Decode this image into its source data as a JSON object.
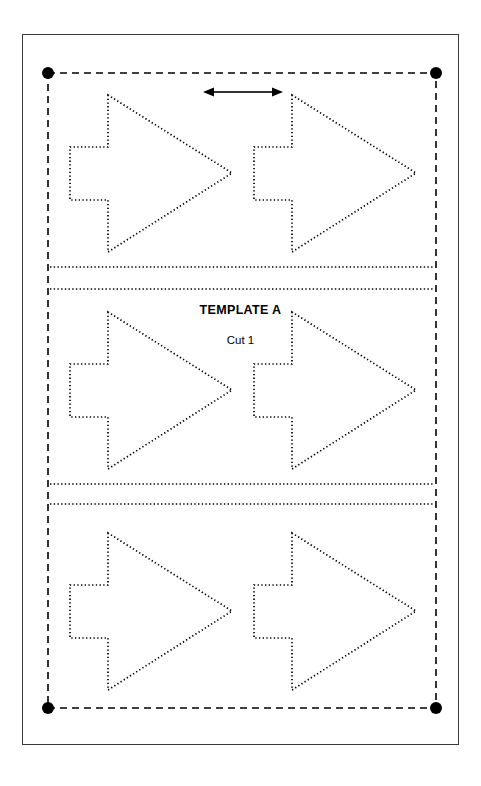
{
  "page": {
    "background_color": "#ffffff",
    "frame": {
      "color": "#3a3a3a",
      "x": 22,
      "y": 34,
      "width": 437,
      "height": 711
    }
  },
  "labels": {
    "template_name": "TEMPLATE A",
    "cut_label": "Cut 1"
  },
  "colors": {
    "ink": "#000000",
    "frame": "#3a3a3a",
    "paper": "#ffffff"
  },
  "fabric_boundary": {
    "style": "dashed",
    "stroke": "#000000",
    "x": 48,
    "y": 73,
    "width": 388,
    "height": 635,
    "corner_markers": [
      {
        "name": "top-left",
        "x": 48,
        "y": 73
      },
      {
        "name": "top-right",
        "x": 436,
        "y": 73
      },
      {
        "name": "bottom-left",
        "x": 48,
        "y": 708
      },
      {
        "name": "bottom-right",
        "x": 436,
        "y": 708
      }
    ],
    "corner_marker_radius": 6
  },
  "dimension_arrow": {
    "name": "width-dimension",
    "orientation": "horizontal",
    "double_headed": true,
    "x1": 203,
    "x2": 283,
    "y": 92,
    "stroke": "#333333"
  },
  "cut_lines": [
    {
      "name": "cut-line-1",
      "y": 267,
      "x1": 50,
      "x2": 434
    },
    {
      "name": "cut-line-2",
      "y": 289,
      "x1": 50,
      "x2": 434
    },
    {
      "name": "cut-line-3",
      "y": 484,
      "x1": 50,
      "x2": 434
    },
    {
      "name": "cut-line-4",
      "y": 504,
      "x1": 50,
      "x2": 434
    }
  ],
  "arrow_shape": {
    "description": "right-pointing arrow with rectangular tab notch on left",
    "dotted_outline": true,
    "stroke": "#000000",
    "nominal_width": 165,
    "nominal_height": 155
  },
  "arrow_pieces": [
    {
      "name": "arrow-r1-c1",
      "row": 1,
      "column": 1,
      "x": 70,
      "y": 95
    },
    {
      "name": "arrow-r1-c2",
      "row": 1,
      "column": 2,
      "x": 254,
      "y": 95
    },
    {
      "name": "arrow-r2-c1",
      "row": 2,
      "column": 1,
      "x": 70,
      "y": 312
    },
    {
      "name": "arrow-r2-c2",
      "row": 2,
      "column": 2,
      "x": 254,
      "y": 312
    },
    {
      "name": "arrow-r3-c1",
      "row": 3,
      "column": 1,
      "x": 70,
      "y": 533
    },
    {
      "name": "arrow-r3-c2",
      "row": 3,
      "column": 2,
      "x": 254,
      "y": 533
    }
  ]
}
